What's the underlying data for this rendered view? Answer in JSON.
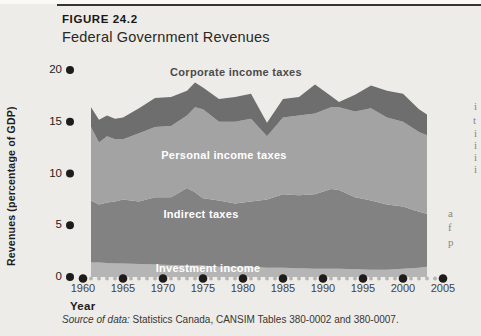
{
  "figure": {
    "label": "FIGURE 24.2",
    "title": "Federal Government Revenues"
  },
  "source": {
    "prefix": "Source of data:",
    "text": " Statistics Canada, CANSIM Tables 380-0002 and 380-0007."
  },
  "right_margin_fragments": [
    {
      "ch": "i",
      "x": 474,
      "y": 100
    },
    {
      "ch": "t",
      "x": 473,
      "y": 114
    },
    {
      "ch": "i",
      "x": 474,
      "y": 127
    },
    {
      "ch": "i",
      "x": 474,
      "y": 139
    },
    {
      "ch": "i",
      "x": 474,
      "y": 151
    },
    {
      "ch": "i",
      "x": 474,
      "y": 163
    },
    {
      "ch": "a",
      "x": 448,
      "y": 207
    },
    {
      "ch": "f",
      "x": 448,
      "y": 221
    },
    {
      "ch": "p",
      "x": 448,
      "y": 236
    }
  ],
  "chart_data": {
    "type": "area",
    "stacked": true,
    "title": "Federal Government Revenues",
    "xlabel": "Year",
    "ylabel": "Revenues (percentage of GDP)",
    "xlim": [
      1960,
      2005
    ],
    "ylim": [
      0,
      20
    ],
    "x_ticks": [
      1960,
      1965,
      1970,
      1975,
      1980,
      1985,
      1990,
      1995,
      2000,
      2005
    ],
    "y_ticks": [
      0,
      5,
      10,
      15,
      20
    ],
    "grid": false,
    "legend": "labels-on-areas",
    "units": "percentage of GDP",
    "x": [
      1961,
      1962,
      1963,
      1964,
      1965,
      1967,
      1969,
      1971,
      1973,
      1974,
      1975,
      1977,
      1979,
      1981,
      1983,
      1985,
      1987,
      1989,
      1991,
      1992,
      1994,
      1996,
      1998,
      2000,
      2002,
      2003
    ],
    "series": [
      {
        "name": "Investment income",
        "color": "#b5b5b5",
        "values": [
          1.4,
          1.4,
          1.35,
          1.3,
          1.3,
          1.25,
          1.2,
          1.15,
          1.1,
          1.1,
          1.1,
          1.0,
          1.0,
          1.0,
          0.9,
          0.9,
          0.85,
          0.8,
          0.8,
          0.8,
          0.75,
          0.7,
          0.7,
          0.8,
          0.9,
          1.0
        ]
      },
      {
        "name": "Indirect taxes",
        "color": "#828282",
        "values": [
          6.0,
          5.6,
          5.85,
          6.0,
          6.2,
          6.05,
          6.5,
          6.55,
          7.5,
          7.1,
          6.5,
          6.4,
          6.1,
          6.3,
          6.6,
          7.1,
          7.05,
          7.2,
          7.7,
          7.6,
          6.95,
          6.7,
          6.3,
          6.0,
          5.4,
          5.1
        ]
      },
      {
        "name": "Personal income taxes",
        "color": "#a3a3a3",
        "values": [
          7.1,
          6.0,
          6.4,
          6.0,
          5.8,
          6.6,
          6.8,
          6.9,
          7.0,
          8.2,
          8.6,
          7.6,
          7.9,
          8.0,
          6.1,
          7.4,
          7.7,
          7.8,
          7.9,
          8.0,
          8.3,
          8.9,
          8.4,
          8.2,
          7.7,
          7.6
        ]
      },
      {
        "name": "Corporate income taxes",
        "color": "#6e6e6e",
        "values": [
          1.9,
          2.2,
          2.0,
          2.0,
          2.1,
          2.4,
          2.8,
          2.8,
          2.4,
          2.4,
          2.1,
          2.2,
          2.4,
          2.4,
          1.3,
          1.8,
          1.8,
          2.8,
          1.1,
          0.5,
          1.6,
          2.2,
          2.6,
          2.7,
          2.2,
          2.0
        ]
      }
    ]
  }
}
